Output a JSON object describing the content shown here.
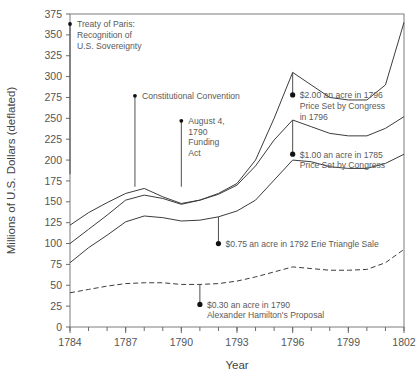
{
  "chart_data": {
    "type": "line",
    "title": "",
    "xlabel": "Year",
    "ylabel": "Millions of U.S. Dollars (deflated)",
    "xlim": [
      1784,
      1802
    ],
    "ylim": [
      0,
      375
    ],
    "ytick_step": 25,
    "xtick_step": 3,
    "xminor_step": 1,
    "grid": false,
    "legend": "none",
    "yticks": [
      "0",
      "25",
      "50",
      "75",
      "100",
      "125",
      "150",
      "175",
      "200",
      "225",
      "250",
      "275",
      "300",
      "325",
      "350",
      "375"
    ],
    "xticks": [
      "1784",
      "1787",
      "1790",
      "1793",
      "1796",
      "1799",
      "1802"
    ],
    "x": [
      1784,
      1785,
      1786,
      1787,
      1788,
      1789,
      1790,
      1791,
      1792,
      1793,
      1794,
      1795,
      1796,
      1797,
      1798,
      1799,
      1800,
      1801,
      1802
    ],
    "series": [
      {
        "name": "series-1-upper",
        "style": "solid",
        "values": [
          122,
          137,
          149,
          160,
          166,
          156,
          148,
          152,
          160,
          172,
          200,
          250,
          305,
          290,
          275,
          272,
          272,
          290,
          365
        ]
      },
      {
        "name": "series-2",
        "style": "solid",
        "values": [
          100,
          117,
          134,
          152,
          158,
          154,
          147,
          152,
          159,
          170,
          193,
          224,
          248,
          240,
          232,
          229,
          229,
          238,
          252
        ]
      },
      {
        "name": "series-3",
        "style": "solid",
        "values": [
          77,
          95,
          110,
          126,
          133,
          131,
          127,
          128,
          132,
          139,
          152,
          176,
          200,
          198,
          192,
          190,
          190,
          196,
          207
        ]
      },
      {
        "name": "series-4-dashed",
        "style": "dashed",
        "values": [
          41,
          45,
          49,
          52,
          53,
          53,
          51,
          51,
          52,
          55,
          60,
          66,
          72,
          70,
          68,
          68,
          69,
          77,
          93
        ]
      }
    ],
    "annotations": [
      {
        "id": "treaty-of-paris",
        "lines": [
          "Treaty of Paris:",
          "Recognition of",
          "U.S. Sovereignty"
        ],
        "marker_year": 1784,
        "marker_value": 363,
        "leader_to_value": 183
      },
      {
        "id": "constitutional-convention",
        "lines": [
          "Constitutional Convention"
        ],
        "marker_year": 1787.5,
        "marker_value": 277,
        "leader_to_value": 168
      },
      {
        "id": "funding-act",
        "lines": [
          "August 4,",
          "1790",
          "Funding",
          "Act"
        ],
        "marker_year": 1790,
        "marker_value": 247,
        "leader_to_value": 168
      },
      {
        "id": "two-dollar-acre-1796",
        "lines": [
          "$2.00 an acre in 1796",
          "Price Set by Congress",
          "in  1796"
        ],
        "marker_year": 1796,
        "marker_value": 278,
        "leader_to_value": 305
      },
      {
        "id": "one-dollar-acre-1785",
        "lines": [
          "$1.00 an acre in 1785",
          "Price Set by Congress"
        ],
        "marker_year": 1796,
        "marker_value": 207,
        "leader_to_value": 248
      },
      {
        "id": "erie-triangle-sale-1792",
        "lines": [
          "$0.75 an acre in 1792 Erie Triangle Sale"
        ],
        "marker_year": 1792,
        "marker_value": 100,
        "leader_to_value": 132
      },
      {
        "id": "hamilton-proposal-1790",
        "lines": [
          "$0.30 an acre in 1790",
          "Alexander Hamilton's Proposal"
        ],
        "marker_year": 1791,
        "marker_value": 27,
        "leader_to_value": 51
      }
    ]
  },
  "axis": {
    "y_title": "Millions of U.S. Dollars (deflated)",
    "x_title": "Year"
  }
}
